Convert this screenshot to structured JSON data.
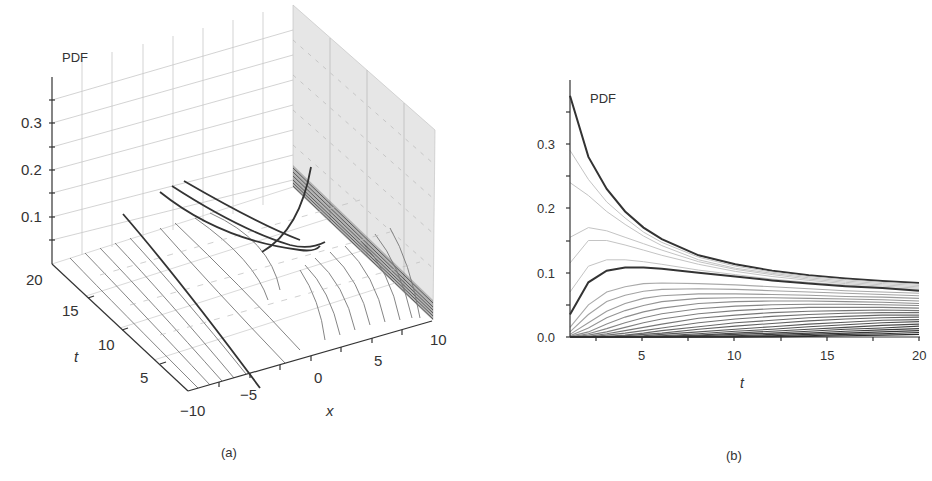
{
  "chart_data": [
    {
      "id": "a",
      "type": "surface3d",
      "caption": "(a)",
      "zlabel": "PDF",
      "xlabel": "x",
      "ylabel": "t",
      "z_ticks": [
        "0.1",
        "0.2",
        "0.3"
      ],
      "zlim": [
        0,
        0.38
      ],
      "t_ticks": [
        "5",
        "10",
        "15",
        "20"
      ],
      "tlim": [
        1,
        20
      ],
      "x_ticks": [
        "-10",
        "-5",
        "0",
        "5",
        "10"
      ],
      "xlim": [
        -10,
        10
      ],
      "description": "3D waterfall of PDF(x,t) curves over x in [-10,10] and t in [1,20]; gray wall on right face, several highlighted dark curves"
    },
    {
      "id": "b",
      "type": "line",
      "caption": "(b)",
      "title": "",
      "ylabel": "PDF",
      "xlabel": "t",
      "x_ticks": [
        "5",
        "10",
        "15",
        "20"
      ],
      "y_ticks": [
        "0.0",
        "0.1",
        "0.2",
        "0.3"
      ],
      "xlim": [
        1,
        20
      ],
      "ylim": [
        0,
        0.38
      ],
      "grid": false,
      "x": [
        1,
        2,
        3,
        4,
        5,
        6,
        8,
        10,
        12,
        14,
        16,
        18,
        20
      ],
      "series": [
        {
          "name": "top (dark)",
          "emphasis": "dark",
          "values": [
            0.375,
            0.28,
            0.23,
            0.195,
            0.17,
            0.152,
            0.127,
            0.113,
            0.103,
            0.096,
            0.091,
            0.087,
            0.084
          ]
        },
        {
          "name": "light 1",
          "emphasis": "light",
          "values": [
            0.29,
            0.245,
            0.21,
            0.185,
            0.163,
            0.147,
            0.124,
            0.11,
            0.101,
            0.094,
            0.089,
            0.085,
            0.082
          ]
        },
        {
          "name": "light 2",
          "emphasis": "light",
          "values": [
            0.24,
            0.22,
            0.195,
            0.175,
            0.157,
            0.142,
            0.12,
            0.107,
            0.099,
            0.092,
            0.087,
            0.083,
            0.08
          ]
        },
        {
          "name": "light 3",
          "emphasis": "light",
          "values": [
            0.155,
            0.17,
            0.165,
            0.155,
            0.145,
            0.135,
            0.117,
            0.105,
            0.097,
            0.09,
            0.085,
            0.081,
            0.078
          ]
        },
        {
          "name": "light 4",
          "emphasis": "light",
          "values": [
            0.115,
            0.15,
            0.15,
            0.143,
            0.135,
            0.127,
            0.113,
            0.102,
            0.094,
            0.088,
            0.083,
            0.079,
            0.076
          ]
        },
        {
          "name": "light 5",
          "emphasis": "light",
          "values": [
            0.07,
            0.11,
            0.12,
            0.12,
            0.117,
            0.113,
            0.104,
            0.097,
            0.09,
            0.085,
            0.081,
            0.077,
            0.074
          ]
        },
        {
          "name": "middle (dark)",
          "emphasis": "dark",
          "values": [
            0.035,
            0.085,
            0.103,
            0.108,
            0.108,
            0.106,
            0.1,
            0.094,
            0.088,
            0.083,
            0.079,
            0.076,
            0.072
          ]
        },
        {
          "name": "s8",
          "emphasis": "mid",
          "values": [
            0.015,
            0.05,
            0.07,
            0.078,
            0.083,
            0.084,
            0.083,
            0.081,
            0.078,
            0.075,
            0.072,
            0.07,
            0.068
          ]
        },
        {
          "name": "s9",
          "emphasis": "mid",
          "values": [
            0.008,
            0.035,
            0.055,
            0.065,
            0.071,
            0.074,
            0.075,
            0.074,
            0.072,
            0.07,
            0.068,
            0.066,
            0.064
          ]
        },
        {
          "name": "s10",
          "emphasis": "mid",
          "values": [
            0.004,
            0.022,
            0.04,
            0.052,
            0.06,
            0.064,
            0.067,
            0.067,
            0.066,
            0.065,
            0.063,
            0.062,
            0.06
          ]
        },
        {
          "name": "s11",
          "emphasis": "mid",
          "values": [
            0.002,
            0.014,
            0.03,
            0.041,
            0.049,
            0.055,
            0.06,
            0.061,
            0.061,
            0.06,
            0.059,
            0.058,
            0.056
          ]
        },
        {
          "name": "s12",
          "emphasis": "mid",
          "values": [
            0.001,
            0.008,
            0.02,
            0.031,
            0.039,
            0.045,
            0.052,
            0.055,
            0.056,
            0.056,
            0.055,
            0.054,
            0.052
          ]
        },
        {
          "name": "s13",
          "emphasis": "mid",
          "values": [
            0.0,
            0.005,
            0.013,
            0.022,
            0.03,
            0.036,
            0.044,
            0.048,
            0.05,
            0.051,
            0.051,
            0.05,
            0.049
          ]
        },
        {
          "name": "s14",
          "emphasis": "mid",
          "values": [
            0.0,
            0.003,
            0.008,
            0.015,
            0.022,
            0.028,
            0.036,
            0.041,
            0.044,
            0.046,
            0.046,
            0.046,
            0.045
          ]
        },
        {
          "name": "s15",
          "emphasis": "mid",
          "values": [
            0.0,
            0.001,
            0.005,
            0.01,
            0.015,
            0.02,
            0.029,
            0.034,
            0.038,
            0.04,
            0.041,
            0.042,
            0.041
          ]
        },
        {
          "name": "s16",
          "emphasis": "mid",
          "values": [
            0.0,
            0.0,
            0.003,
            0.006,
            0.01,
            0.014,
            0.022,
            0.028,
            0.032,
            0.035,
            0.037,
            0.038,
            0.038
          ]
        },
        {
          "name": "s17",
          "emphasis": "mid",
          "values": [
            0.0,
            0.0,
            0.001,
            0.003,
            0.006,
            0.01,
            0.016,
            0.022,
            0.026,
            0.03,
            0.032,
            0.034,
            0.034
          ]
        },
        {
          "name": "s18",
          "emphasis": "mid",
          "values": [
            0.0,
            0.0,
            0.0,
            0.002,
            0.004,
            0.006,
            0.012,
            0.017,
            0.021,
            0.025,
            0.028,
            0.03,
            0.031
          ]
        },
        {
          "name": "s19",
          "emphasis": "mid",
          "values": [
            0.0,
            0.0,
            0.0,
            0.001,
            0.002,
            0.004,
            0.008,
            0.012,
            0.016,
            0.02,
            0.023,
            0.026,
            0.027
          ]
        },
        {
          "name": "s20",
          "emphasis": "mid",
          "values": [
            0.0,
            0.0,
            0.0,
            0.0,
            0.001,
            0.002,
            0.005,
            0.009,
            0.012,
            0.016,
            0.019,
            0.022,
            0.024
          ]
        },
        {
          "name": "s21",
          "emphasis": "mid",
          "values": [
            0.0,
            0.0,
            0.0,
            0.0,
            0.0,
            0.001,
            0.003,
            0.006,
            0.009,
            0.012,
            0.015,
            0.018,
            0.02
          ]
        },
        {
          "name": "s22",
          "emphasis": "mid",
          "values": [
            0.0,
            0.0,
            0.0,
            0.0,
            0.0,
            0.0,
            0.002,
            0.004,
            0.006,
            0.009,
            0.012,
            0.014,
            0.017
          ]
        },
        {
          "name": "s23",
          "emphasis": "mid",
          "values": [
            0.0,
            0.0,
            0.0,
            0.0,
            0.0,
            0.0,
            0.001,
            0.002,
            0.004,
            0.006,
            0.009,
            0.011,
            0.013
          ]
        },
        {
          "name": "s24",
          "emphasis": "mid",
          "values": [
            0.0,
            0.0,
            0.0,
            0.0,
            0.0,
            0.0,
            0.0,
            0.001,
            0.002,
            0.004,
            0.006,
            0.008,
            0.01
          ]
        },
        {
          "name": "s25",
          "emphasis": "mid",
          "values": [
            0.0,
            0.0,
            0.0,
            0.0,
            0.0,
            0.0,
            0.0,
            0.0,
            0.001,
            0.002,
            0.004,
            0.005,
            0.007
          ]
        },
        {
          "name": "s26",
          "emphasis": "mid",
          "values": [
            0.0,
            0.0,
            0.0,
            0.0,
            0.0,
            0.0,
            0.0,
            0.0,
            0.0,
            0.001,
            0.002,
            0.003,
            0.004
          ]
        }
      ]
    }
  ],
  "labels": {
    "a_caption": "(a)",
    "b_caption": "(b)",
    "a_zlabel": "PDF",
    "a_xlabel": "x",
    "a_tlabel": "t",
    "a_z_ticks": [
      "0.1",
      "0.2",
      "0.3"
    ],
    "a_t_ticks": [
      "20",
      "15",
      "10",
      "5"
    ],
    "a_x_ticks": [
      "−10",
      "−5",
      "0",
      "5",
      "10"
    ],
    "b_ylabel": "PDF",
    "b_xlabel": "t",
    "b_x_ticks": [
      "5",
      "10",
      "15",
      "20"
    ],
    "b_y_ticks": [
      "0.0",
      "0.1",
      "0.2",
      "0.3"
    ]
  }
}
